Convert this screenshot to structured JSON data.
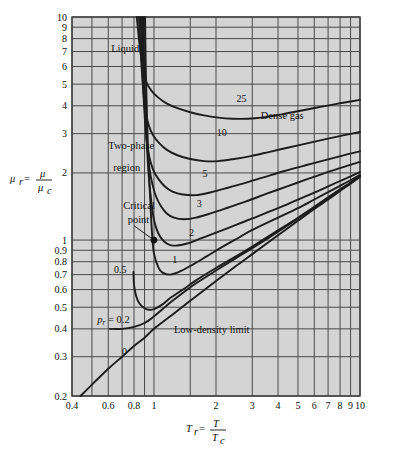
{
  "chart_data": {
    "type": "line",
    "title": "",
    "xlabel": "T_r = T / T_c",
    "ylabel": "mu_r = mu / mu_c",
    "xscale": "log",
    "yscale": "log",
    "xlim": [
      0.4,
      10
    ],
    "ylim": [
      0.2,
      10
    ],
    "grid": true,
    "legend": "inline curve labels",
    "x_ticks": [
      "0.4",
      "0.6",
      "0.8",
      "1",
      "2",
      "3",
      "4",
      "5",
      "6",
      "7",
      "8",
      "9",
      "10"
    ],
    "x_tick_values": [
      0.4,
      0.6,
      0.8,
      1,
      2,
      3,
      4,
      5,
      6,
      7,
      8,
      9,
      10
    ],
    "y_ticks": [
      "0.2",
      "0.3",
      "0.4",
      "0.5",
      "0.6",
      "0.7",
      "0.8",
      "0.9",
      "1",
      "2",
      "3",
      "4",
      "5",
      "6",
      "7",
      "8",
      "9",
      "10"
    ],
    "y_tick_values": [
      0.2,
      0.3,
      0.4,
      0.5,
      0.6,
      0.7,
      0.8,
      0.9,
      1,
      2,
      3,
      4,
      5,
      6,
      7,
      8,
      9,
      10
    ],
    "annotations": [
      {
        "name": "liquid",
        "text": "Liquid",
        "x": 0.62,
        "y": 7.0
      },
      {
        "name": "two-phase-region-1",
        "text": "Two-phase",
        "x": 0.6,
        "y": 2.55
      },
      {
        "name": "two-phase-region-2",
        "text": "region",
        "x": 0.635,
        "y": 2.05
      },
      {
        "name": "dense-gas",
        "text": "Dense gas",
        "x": 3.3,
        "y": 3.5
      },
      {
        "name": "critical-point-1",
        "text": "Critical",
        "x": 0.71,
        "y": 1.38
      },
      {
        "name": "critical-point-2",
        "text": "point",
        "x": 0.745,
        "y": 1.19
      },
      {
        "name": "low-density-limit",
        "text": "Low-density limit",
        "x": 1.25,
        "y": 0.385
      },
      {
        "name": "pr-0-2",
        "text": "p_r = 0.2",
        "x": 0.53,
        "y": 0.425
      }
    ],
    "critical_point": {
      "x": 1.0,
      "y": 1.0,
      "label": "Critical point"
    },
    "series": [
      {
        "name": "pr = 0",
        "label": "0",
        "label_x": 0.72,
        "label_y": 0.305,
        "points": [
          [
            0.44,
            0.2
          ],
          [
            0.5,
            0.225
          ],
          [
            0.6,
            0.265
          ],
          [
            0.7,
            0.3
          ],
          [
            0.8,
            0.335
          ],
          [
            0.9,
            0.365
          ],
          [
            1.0,
            0.4
          ],
          [
            1.2,
            0.455
          ],
          [
            1.5,
            0.535
          ],
          [
            2.0,
            0.655
          ],
          [
            2.5,
            0.765
          ],
          [
            3.0,
            0.865
          ],
          [
            4.0,
            1.05
          ],
          [
            5.0,
            1.22
          ],
          [
            6.0,
            1.38
          ],
          [
            7.0,
            1.52
          ],
          [
            8.0,
            1.66
          ],
          [
            9.0,
            1.79
          ],
          [
            10.0,
            1.92
          ]
        ]
      },
      {
        "name": "pr = 0.2",
        "label": "p_r = 0.2",
        "points": [
          [
            0.61,
            0.4
          ],
          [
            0.7,
            0.4
          ],
          [
            0.8,
            0.408
          ],
          [
            0.9,
            0.425
          ],
          [
            1.0,
            0.455
          ],
          [
            1.1,
            0.49
          ],
          [
            1.2,
            0.525
          ],
          [
            1.4,
            0.585
          ],
          [
            1.6,
            0.64
          ],
          [
            2.0,
            0.73
          ],
          [
            2.5,
            0.83
          ],
          [
            3.0,
            0.92
          ],
          [
            4.0,
            1.09
          ],
          [
            5.0,
            1.25
          ],
          [
            6.0,
            1.4
          ],
          [
            7.0,
            1.545
          ],
          [
            8.0,
            1.68
          ],
          [
            9.0,
            1.8
          ],
          [
            10.0,
            1.93
          ]
        ]
      },
      {
        "name": "pr = 0.5",
        "label": "0.5",
        "label_x": 0.685,
        "label_y": 0.715,
        "points": [
          [
            0.795,
            0.72
          ],
          [
            0.8,
            0.63
          ],
          [
            0.82,
            0.56
          ],
          [
            0.85,
            0.52
          ],
          [
            0.9,
            0.495
          ],
          [
            0.95,
            0.487
          ],
          [
            1.0,
            0.49
          ],
          [
            1.1,
            0.515
          ],
          [
            1.2,
            0.55
          ],
          [
            1.4,
            0.605
          ],
          [
            1.6,
            0.66
          ],
          [
            2.0,
            0.75
          ],
          [
            2.5,
            0.845
          ],
          [
            3.0,
            0.935
          ],
          [
            4.0,
            1.105
          ],
          [
            5.0,
            1.26
          ],
          [
            6.0,
            1.41
          ],
          [
            7.0,
            1.555
          ],
          [
            8.0,
            1.69
          ],
          [
            9.0,
            1.81
          ],
          [
            10.0,
            1.94
          ]
        ]
      },
      {
        "name": "pr = 1",
        "label": "1",
        "label_x": 1.26,
        "label_y": 0.79,
        "points": [
          [
            0.905,
            10
          ],
          [
            0.912,
            6
          ],
          [
            0.922,
            4
          ],
          [
            0.935,
            2.6
          ],
          [
            0.95,
            1.8
          ],
          [
            0.965,
            1.35
          ],
          [
            0.98,
            1.05
          ],
          [
            1.0,
            0.87
          ],
          [
            1.05,
            0.755
          ],
          [
            1.1,
            0.715
          ],
          [
            1.2,
            0.7
          ],
          [
            1.3,
            0.715
          ],
          [
            1.5,
            0.765
          ],
          [
            1.8,
            0.845
          ],
          [
            2.2,
            0.945
          ],
          [
            2.6,
            1.03
          ],
          [
            3.0,
            1.11
          ],
          [
            4.0,
            1.26
          ],
          [
            5.0,
            1.39
          ],
          [
            6.0,
            1.52
          ],
          [
            7.0,
            1.64
          ],
          [
            8.0,
            1.75
          ],
          [
            9.0,
            1.855
          ],
          [
            10.0,
            1.96
          ]
        ]
      },
      {
        "name": "pr = 2",
        "label": "2",
        "label_x": 1.52,
        "label_y": 1.04,
        "points": [
          [
            0.885,
            10
          ],
          [
            0.895,
            6
          ],
          [
            0.907,
            4
          ],
          [
            0.925,
            2.6
          ],
          [
            0.945,
            1.9
          ],
          [
            0.97,
            1.5
          ],
          [
            1.0,
            1.23
          ],
          [
            1.05,
            1.07
          ],
          [
            1.12,
            0.985
          ],
          [
            1.2,
            0.95
          ],
          [
            1.3,
            0.945
          ],
          [
            1.45,
            0.965
          ],
          [
            1.7,
            1.02
          ],
          [
            2.0,
            1.08
          ],
          [
            2.5,
            1.17
          ],
          [
            3.0,
            1.25
          ],
          [
            4.0,
            1.39
          ],
          [
            5.0,
            1.52
          ],
          [
            6.0,
            1.63
          ],
          [
            7.0,
            1.74
          ],
          [
            8.0,
            1.84
          ],
          [
            9.0,
            1.93
          ],
          [
            10.0,
            2.02
          ]
        ]
      },
      {
        "name": "pr = 3",
        "label": "3",
        "label_x": 1.66,
        "label_y": 1.41,
        "points": [
          [
            0.875,
            10
          ],
          [
            0.888,
            6
          ],
          [
            0.902,
            4
          ],
          [
            0.922,
            2.8
          ],
          [
            0.95,
            2.1
          ],
          [
            0.98,
            1.8
          ],
          [
            1.02,
            1.58
          ],
          [
            1.08,
            1.42
          ],
          [
            1.15,
            1.32
          ],
          [
            1.25,
            1.26
          ],
          [
            1.4,
            1.24
          ],
          [
            1.6,
            1.26
          ],
          [
            1.9,
            1.32
          ],
          [
            2.3,
            1.4
          ],
          [
            2.8,
            1.49
          ],
          [
            3.5,
            1.61
          ],
          [
            4.5,
            1.75
          ],
          [
            5.5,
            1.87
          ],
          [
            7.0,
            2.02
          ],
          [
            8.5,
            2.14
          ],
          [
            10.0,
            2.24
          ]
        ]
      },
      {
        "name": "pr = 5",
        "label": "5",
        "label_x": 1.77,
        "label_y": 1.92,
        "points": [
          [
            0.862,
            10
          ],
          [
            0.878,
            6
          ],
          [
            0.895,
            4
          ],
          [
            0.918,
            2.9
          ],
          [
            0.95,
            2.35
          ],
          [
            0.99,
            2.07
          ],
          [
            1.05,
            1.88
          ],
          [
            1.13,
            1.74
          ],
          [
            1.23,
            1.65
          ],
          [
            1.38,
            1.6
          ],
          [
            1.6,
            1.59
          ],
          [
            1.85,
            1.63
          ],
          [
            2.2,
            1.7
          ],
          [
            2.7,
            1.79
          ],
          [
            3.4,
            1.91
          ],
          [
            4.3,
            2.04
          ],
          [
            5.5,
            2.17
          ],
          [
            7.0,
            2.3
          ],
          [
            8.5,
            2.41
          ],
          [
            10.0,
            2.5
          ]
        ]
      },
      {
        "name": "pr = 10",
        "label": "10",
        "label_x": 2.13,
        "label_y": 2.92,
        "points": [
          [
            0.845,
            10
          ],
          [
            0.862,
            7
          ],
          [
            0.882,
            5
          ],
          [
            0.908,
            3.8
          ],
          [
            0.945,
            3.25
          ],
          [
            0.99,
            2.95
          ],
          [
            1.06,
            2.72
          ],
          [
            1.16,
            2.53
          ],
          [
            1.3,
            2.4
          ],
          [
            1.5,
            2.31
          ],
          [
            1.75,
            2.26
          ],
          [
            2.05,
            2.26
          ],
          [
            2.45,
            2.31
          ],
          [
            2.95,
            2.38
          ],
          [
            3.6,
            2.48
          ],
          [
            4.5,
            2.6
          ],
          [
            5.6,
            2.72
          ],
          [
            7.0,
            2.85
          ],
          [
            8.5,
            2.96
          ],
          [
            10.0,
            3.05
          ]
        ]
      },
      {
        "name": "pr = 25",
        "label": "25",
        "label_x": 2.66,
        "label_y": 4.15,
        "points": [
          [
            0.825,
            10
          ],
          [
            0.85,
            7.6
          ],
          [
            0.88,
            6.0
          ],
          [
            0.92,
            5.1
          ],
          [
            0.975,
            4.65
          ],
          [
            1.05,
            4.35
          ],
          [
            1.15,
            4.1
          ],
          [
            1.3,
            3.9
          ],
          [
            1.5,
            3.74
          ],
          [
            1.75,
            3.62
          ],
          [
            2.05,
            3.54
          ],
          [
            2.4,
            3.5
          ],
          [
            2.85,
            3.5
          ],
          [
            3.4,
            3.55
          ],
          [
            4.1,
            3.65
          ],
          [
            5.0,
            3.78
          ],
          [
            6.2,
            3.93
          ],
          [
            7.6,
            4.07
          ],
          [
            9.0,
            4.18
          ],
          [
            10.0,
            4.25
          ]
        ]
      }
    ]
  }
}
